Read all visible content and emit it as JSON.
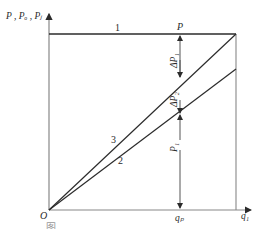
{
  "diagram": {
    "y_axis_label": "P , Pₒ , Pⱼ",
    "x_axis_end_label": "q₁",
    "origin_label": "O",
    "qp_label": "qₚ",
    "top_point_label": "P",
    "line_labels": {
      "line1": "1",
      "line2": "2",
      "line3": "3"
    },
    "segment_labels": {
      "delta_p1": "ΔP₁",
      "delta_p2": "ΔP₂",
      "p1": "P₁"
    },
    "caption": "图 … … …"
  },
  "colors": {
    "line": "#2b2b2b",
    "axis": "#888888",
    "background": "#ffffff"
  }
}
